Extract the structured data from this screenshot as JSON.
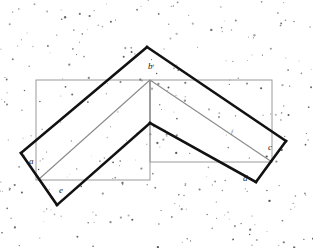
{
  "figure": {
    "background": "#ffffff",
    "width": 313,
    "height": 248,
    "colors": {
      "bold_stroke": "#111111",
      "thin_stroke": "#8a8a8a",
      "rect_stroke": "#9a9a9a",
      "label_color": "#1a1a1a",
      "noise_dot": "#3a3a3a"
    },
    "labels": [
      {
        "id": "label-a",
        "text": "a",
        "x": 29,
        "y": 157
      },
      {
        "id": "label-b",
        "text": "b",
        "x": 148,
        "y": 62
      },
      {
        "id": "label-c",
        "text": "c",
        "x": 268,
        "y": 143
      },
      {
        "id": "label-d",
        "text": "d",
        "x": 243,
        "y": 174
      },
      {
        "id": "label-e",
        "text": "e",
        "x": 59,
        "y": 186
      },
      {
        "id": "label-f",
        "text": "f",
        "x": 231,
        "y": 129
      }
    ],
    "rectangles": [
      {
        "id": "left-rectangle",
        "x": 36,
        "y": 80,
        "width": 114,
        "height": 100
      },
      {
        "id": "right-rectangle",
        "x": 150,
        "y": 80,
        "width": 122,
        "height": 82
      }
    ],
    "bold_polyline": {
      "id": "bold-chevron-outline",
      "points": "21,153 50,126 147,47 176,75 266,154 286,141 256,112 153,80 150,123 174,148 150,172 128,148 95,118 57,205 27,178"
    },
    "bold_segments": [
      {
        "id": "seg-a-left-upper",
        "points": "21,153 147,47"
      },
      {
        "id": "seg-b-right-down",
        "points": "147,47 286,141"
      },
      {
        "id": "seg-c-corner",
        "points": "286,141 256,182"
      },
      {
        "id": "seg-d-back",
        "points": "256,182 150,123"
      },
      {
        "id": "seg-inner-left",
        "points": "150,123 57,205"
      },
      {
        "id": "seg-e-corner",
        "points": "57,205 21,153"
      }
    ],
    "thin_segments": [
      {
        "id": "thin-left-diagonal",
        "points": "38,180 150,80"
      },
      {
        "id": "thin-right-diagonal",
        "points": "150,80 272,162"
      },
      {
        "id": "thin-center-vertical",
        "points": "150,80 150,123"
      }
    ],
    "noise": {
      "id": "background-noise-dots",
      "description": "scattered speckle dots",
      "count": 250,
      "seed": 20240607
    }
  }
}
